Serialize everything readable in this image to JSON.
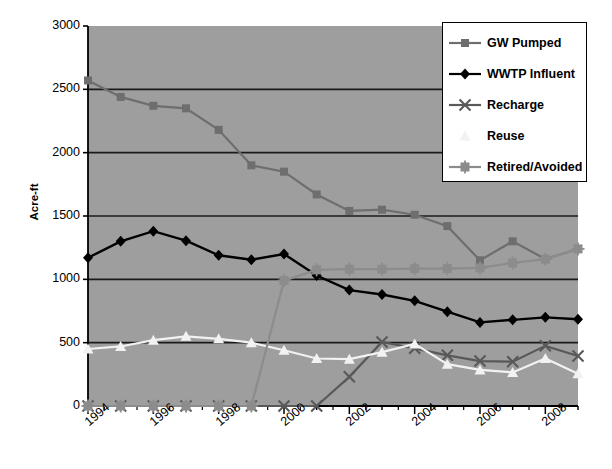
{
  "chart_data": {
    "type": "line",
    "title": "",
    "xlabel": "",
    "ylabel": "Acre-ft",
    "ylim": [
      0,
      3000
    ],
    "yticks": [
      0,
      500,
      1000,
      1500,
      2000,
      2500,
      3000
    ],
    "xlim": [
      1994,
      2009
    ],
    "x": [
      1994,
      1995,
      1996,
      1997,
      1998,
      1999,
      2000,
      2001,
      2002,
      2003,
      2004,
      2005,
      2006,
      2007,
      2008,
      2009
    ],
    "xticks": [
      1994,
      1996,
      1998,
      2000,
      2002,
      2004,
      2006,
      2008
    ],
    "xticklabels": [
      "1994",
      "1996",
      "1998",
      "2000",
      "2002",
      "2004",
      "2006",
      "2008"
    ],
    "grid": "horizontal",
    "legend_position": "top-right",
    "plot_background": "#9e9e9e",
    "series": [
      {
        "name": "GW Pumped",
        "color": "#6e6e6e",
        "marker": "square",
        "values": [
          2570,
          2440,
          2370,
          2350,
          2180,
          1900,
          1850,
          1670,
          1540,
          1550,
          1510,
          1420,
          1150,
          1300,
          1160,
          1240
        ]
      },
      {
        "name": "WWTP Influent",
        "color": "#000000",
        "marker": "diamond",
        "values": [
          1170,
          1300,
          1380,
          1305,
          1190,
          1155,
          1200,
          1030,
          915,
          880,
          830,
          745,
          660,
          680,
          700,
          685
        ]
      },
      {
        "name": "Recharge",
        "color": "#595959",
        "marker": "x",
        "values": [
          0,
          0,
          0,
          0,
          0,
          0,
          0,
          0,
          230,
          505,
          455,
          400,
          355,
          350,
          475,
          395
        ]
      },
      {
        "name": "Reuse",
        "color": "#f2f2f2",
        "marker": "triangle",
        "values": [
          450,
          470,
          520,
          550,
          530,
          500,
          440,
          375,
          370,
          425,
          490,
          330,
          285,
          265,
          375,
          255
        ]
      },
      {
        "name": "Retired/Avoided",
        "color": "#8c8c8c",
        "marker": "square-plus",
        "values": [
          0,
          0,
          0,
          0,
          0,
          0,
          990,
          1075,
          1080,
          1080,
          1085,
          1085,
          1090,
          1130,
          1160,
          1240
        ]
      }
    ]
  },
  "legend": {
    "items": [
      {
        "label": "GW Pumped"
      },
      {
        "label": "WWTP Influent"
      },
      {
        "label": "Recharge"
      },
      {
        "label": "Reuse"
      },
      {
        "label": "Retired/Avoided"
      }
    ]
  }
}
